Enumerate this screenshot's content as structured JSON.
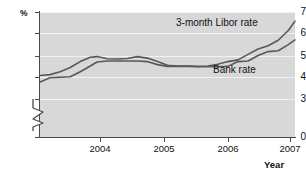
{
  "chart_data": {
    "type": "line",
    "title": "",
    "subtitle": "",
    "xlabel": "Year",
    "ylabel": "%",
    "grid": true,
    "legend_position": "inline-annotations",
    "y_axis": {
      "unit": "%",
      "ticks": [
        0,
        3,
        4,
        5,
        6,
        7
      ],
      "tick_labels": [
        "0",
        "3",
        "4",
        "5",
        "6",
        "7"
      ],
      "ylim": [
        3,
        7
      ],
      "axis_break": true,
      "axis_break_between": [
        0,
        3
      ]
    },
    "x_axis": {
      "label": "Year",
      "ticks": [
        2004,
        2005,
        2006,
        2007
      ],
      "tick_labels": [
        "2004",
        "2005",
        "2006",
        "2007"
      ],
      "xlim": [
        2003.45,
        2007.25
      ]
    },
    "series": [
      {
        "name": "3-month Libor rate",
        "color": "#585858",
        "label_x": 2006.0,
        "label_y": 6.55,
        "x": [
          2003.45,
          2003.6,
          2003.75,
          2003.9,
          2004.05,
          2004.2,
          2004.3,
          2004.45,
          2004.6,
          2004.75,
          2004.9,
          2005.05,
          2005.2,
          2005.35,
          2005.5,
          2005.65,
          2005.8,
          2005.95,
          2006.1,
          2006.25,
          2006.4,
          2006.55,
          2006.7,
          2006.85,
          2007.0,
          2007.15,
          2007.25
        ],
        "values": [
          4.08,
          4.12,
          4.25,
          4.45,
          4.72,
          4.92,
          4.95,
          4.85,
          4.84,
          4.86,
          4.95,
          4.88,
          4.72,
          4.55,
          4.52,
          4.52,
          4.5,
          4.52,
          4.6,
          4.72,
          4.8,
          5.05,
          5.3,
          5.45,
          5.7,
          6.15,
          6.58
        ]
      },
      {
        "name": "Bank rate",
        "color": "#585858",
        "label_x": 2006.35,
        "label_y": 4.78,
        "x": [
          2003.45,
          2003.6,
          2003.75,
          2003.9,
          2004.05,
          2004.2,
          2004.3,
          2004.45,
          2004.6,
          2004.75,
          2004.9,
          2005.05,
          2005.2,
          2005.35,
          2005.5,
          2005.65,
          2005.8,
          2005.95,
          2006.1,
          2006.25,
          2006.4,
          2006.55,
          2006.7,
          2006.85,
          2007.0,
          2007.15,
          2007.25
        ],
        "values": [
          3.78,
          3.98,
          4.0,
          4.02,
          4.25,
          4.52,
          4.7,
          4.75,
          4.75,
          4.75,
          4.75,
          4.72,
          4.58,
          4.5,
          4.5,
          4.5,
          4.48,
          4.48,
          4.48,
          4.5,
          4.72,
          4.75,
          5.0,
          5.18,
          5.22,
          5.5,
          5.72
        ]
      }
    ]
  },
  "axis": {
    "y_unit_label": "%",
    "x_axis_label": "Year",
    "y_tick_labels": [
      "7",
      "6",
      "5",
      "4",
      "3",
      "0"
    ],
    "x_tick_labels": [
      "2004",
      "2005",
      "2006",
      "2007"
    ]
  },
  "annotations": {
    "libor_label": "3-month Libor rate",
    "bank_label": "Bank rate"
  },
  "colors": {
    "plot_background": "#d8d8d8",
    "gridline": "#f2f2f2",
    "axis": "#4a4a4a",
    "series_line": "#585858",
    "text": "#111111",
    "page_background": "#ffffff"
  }
}
